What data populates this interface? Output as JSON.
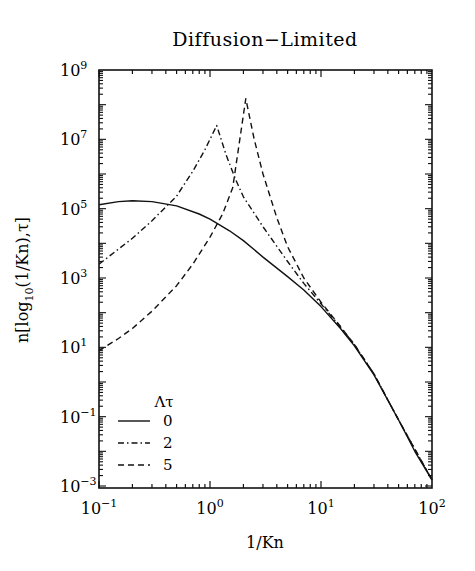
{
  "chart_data": {
    "type": "line",
    "title": "Diffusion−Limited",
    "xlabel": "1/Kn",
    "ylabel": "n[log10(1/Kn),τ]",
    "xscale": "log",
    "yscale": "log",
    "xlim": [
      0.1,
      100
    ],
    "ylim": [
      0.001,
      1000000000
    ],
    "grid": false,
    "x_ticks": [
      {
        "base": "10",
        "exp": "−1",
        "value": 0.1
      },
      {
        "base": "10",
        "exp": "0",
        "value": 1
      },
      {
        "base": "10",
        "exp": "1",
        "value": 10
      },
      {
        "base": "10",
        "exp": "2",
        "value": 100
      }
    ],
    "y_ticks": [
      {
        "base": "10",
        "exp": "9",
        "value": 1000000000.0
      },
      {
        "base": "10",
        "exp": "7",
        "value": 10000000.0
      },
      {
        "base": "10",
        "exp": "5",
        "value": 100000.0
      },
      {
        "base": "10",
        "exp": "3",
        "value": 1000.0
      },
      {
        "base": "10",
        "exp": "1",
        "value": 10
      },
      {
        "base": "10",
        "exp": "−1",
        "value": 0.1
      },
      {
        "base": "10",
        "exp": "−3",
        "value": 0.001
      }
    ],
    "legend": {
      "title": "Λτ",
      "position": "lower-left",
      "entries": [
        {
          "label": "0",
          "style": "solid"
        },
        {
          "label": "2",
          "style": "dash-dot"
        },
        {
          "label": "5",
          "style": "dashed"
        }
      ]
    },
    "series": [
      {
        "name": "Λτ = 0",
        "style": "solid",
        "x": [
          0.1,
          0.15,
          0.2,
          0.3,
          0.5,
          0.8,
          1.0,
          1.5,
          2.0,
          3.0,
          5.0,
          7.0,
          10,
          15,
          20,
          30,
          50,
          70,
          100
        ],
        "y": [
          130000.0,
          160000.0,
          170000.0,
          160000.0,
          120000.0,
          70000.0,
          50000.0,
          23000.0,
          12000.0,
          4000.0,
          1100.0,
          450.0,
          150.0,
          35,
          11,
          1.6,
          0.08,
          0.01,
          0.0015
        ]
      },
      {
        "name": "Λτ = 2",
        "style": "dash-dot",
        "x": [
          0.1,
          0.2,
          0.3,
          0.5,
          0.7,
          0.9,
          1.15,
          1.4,
          1.7,
          2.0,
          3.0,
          5.0,
          7.0,
          10,
          15,
          20,
          30,
          50,
          100
        ],
        "y": [
          2500.0,
          14000.0,
          45000.0,
          230000.0,
          1200000.0,
          5000000.0,
          25000000.0,
          3500000.0,
          700000.0,
          220000.0,
          30000.0,
          3000.0,
          700.0,
          180.0,
          38,
          12,
          1.7,
          0.08,
          0.0015
        ]
      },
      {
        "name": "Λτ = 5",
        "style": "dashed",
        "x": [
          0.1,
          0.15,
          0.2,
          0.3,
          0.5,
          0.7,
          1.0,
          1.3,
          1.6,
          2.1,
          2.5,
          3.0,
          4.0,
          5.0,
          7.0,
          10,
          15,
          20,
          30,
          50,
          100
        ],
        "y": [
          8,
          18,
          35,
          110.0,
          600.0,
          2500.0,
          15000.0,
          70000.0,
          400000.0,
          150000000.0,
          10000000.0,
          1000000.0,
          55000.0,
          8000.0,
          1000.0,
          200.0,
          40,
          12,
          1.7,
          0.08,
          0.0015
        ]
      }
    ]
  }
}
